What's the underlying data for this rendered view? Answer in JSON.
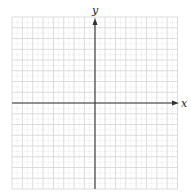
{
  "diagram": {
    "type": "coordinate-grid",
    "x_axis_label": "x",
    "y_axis_label": "y",
    "grid_columns": 16,
    "grid_rows": 16,
    "origin_cell": {
      "col": 8,
      "row": 8
    },
    "colors": {
      "grid_major": "#d4d4d4",
      "grid_minor": "#e6e6e6",
      "axis": "#333333",
      "background": "#ffffff"
    }
  }
}
